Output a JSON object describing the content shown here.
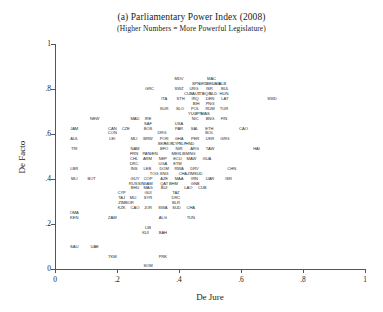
{
  "figure": {
    "title": "(a) Parliamentary Power Index (2008)",
    "subtitle": "(Higher Numbers = More Powerful Legislature)"
  },
  "chart_data": {
    "type": "scatter",
    "title": "(a) Parliamentary Power Index (2008)",
    "subtitle": "(Higher Numbers = More Powerful Legislature)",
    "xlabel": "De Jure",
    "ylabel": "De Facto",
    "xlim": [
      0,
      1
    ],
    "ylim": [
      0,
      1
    ],
    "xticks": [
      "0",
      ".2",
      ".4",
      ".6",
      ".8",
      "1"
    ],
    "xtickvalues": [
      0,
      0.2,
      0.4,
      0.6,
      0.8,
      1
    ],
    "yticks": [
      "0",
      ".2",
      ".4",
      ".6",
      ".8",
      "1"
    ],
    "ytickvalues": [
      0,
      0.2,
      0.4,
      0.6,
      0.8,
      1
    ],
    "grid": false,
    "legend": null,
    "marker_style": "text-label",
    "note": "Each observation is drawn as its three-letter country code instead of a marker.",
    "points": [
      {
        "label": "MDV",
        "x": 0.4,
        "y": 0.845
      },
      {
        "label": "MAC",
        "x": 0.505,
        "y": 0.845
      },
      {
        "label": "SPN",
        "x": 0.455,
        "y": 0.822
      },
      {
        "label": "GRD",
        "x": 0.478,
        "y": 0.822
      },
      {
        "label": "BEL",
        "x": 0.5,
        "y": 0.822
      },
      {
        "label": "VAN",
        "x": 0.52,
        "y": 0.822
      },
      {
        "label": "ALB",
        "x": 0.54,
        "y": 0.822
      },
      {
        "label": "GRC",
        "x": 0.305,
        "y": 0.8
      },
      {
        "label": "SWZ",
        "x": 0.4,
        "y": 0.8
      },
      {
        "label": "URG",
        "x": 0.448,
        "y": 0.8
      },
      {
        "label": "ISR",
        "x": 0.498,
        "y": 0.8
      },
      {
        "label": "BUL",
        "x": 0.548,
        "y": 0.8
      },
      {
        "label": "CUB",
        "x": 0.43,
        "y": 0.778
      },
      {
        "label": "AUT",
        "x": 0.455,
        "y": 0.778
      },
      {
        "label": "ITL",
        "x": 0.472,
        "y": 0.778
      },
      {
        "label": "EQG",
        "x": 0.49,
        "y": 0.778
      },
      {
        "label": "NLD",
        "x": 0.51,
        "y": 0.778
      },
      {
        "label": "HUN",
        "x": 0.545,
        "y": 0.778
      },
      {
        "label": "ITA",
        "x": 0.352,
        "y": 0.756
      },
      {
        "label": "STH",
        "x": 0.405,
        "y": 0.756
      },
      {
        "label": "IRQ",
        "x": 0.452,
        "y": 0.756
      },
      {
        "label": "DEN",
        "x": 0.5,
        "y": 0.756
      },
      {
        "label": "LAT",
        "x": 0.548,
        "y": 0.756
      },
      {
        "label": "SWD",
        "x": 0.7,
        "y": 0.756
      },
      {
        "label": "BIH",
        "x": 0.455,
        "y": 0.734
      },
      {
        "label": "PNG",
        "x": 0.5,
        "y": 0.734
      },
      {
        "label": "SUR",
        "x": 0.352,
        "y": 0.712
      },
      {
        "label": "SLO",
        "x": 0.403,
        "y": 0.712
      },
      {
        "label": "POL",
        "x": 0.452,
        "y": 0.712
      },
      {
        "label": "RUM",
        "x": 0.5,
        "y": 0.712
      },
      {
        "label": "TUR",
        "x": 0.545,
        "y": 0.712
      },
      {
        "label": "YUG",
        "x": 0.443,
        "y": 0.69
      },
      {
        "label": "JPN",
        "x": 0.463,
        "y": 0.69
      },
      {
        "label": "MAS",
        "x": 0.485,
        "y": 0.69
      },
      {
        "label": "NEW",
        "x": 0.128,
        "y": 0.668
      },
      {
        "label": "MAD",
        "x": 0.258,
        "y": 0.668
      },
      {
        "label": "IRE",
        "x": 0.3,
        "y": 0.668
      },
      {
        "label": "NIC",
        "x": 0.452,
        "y": 0.668
      },
      {
        "label": "BNG",
        "x": 0.5,
        "y": 0.668
      },
      {
        "label": "FIN",
        "x": 0.545,
        "y": 0.668
      },
      {
        "label": "SAF",
        "x": 0.3,
        "y": 0.646
      },
      {
        "label": "USA",
        "x": 0.4,
        "y": 0.646
      },
      {
        "label": "JAM",
        "x": 0.062,
        "y": 0.623
      },
      {
        "label": "CAN",
        "x": 0.185,
        "y": 0.623
      },
      {
        "label": "CZE",
        "x": 0.228,
        "y": 0.623
      },
      {
        "label": "BOS",
        "x": 0.3,
        "y": 0.623
      },
      {
        "label": "PAR",
        "x": 0.4,
        "y": 0.623
      },
      {
        "label": "SAL",
        "x": 0.45,
        "y": 0.623
      },
      {
        "label": "ETH",
        "x": 0.498,
        "y": 0.623
      },
      {
        "label": "CAO",
        "x": 0.608,
        "y": 0.623
      },
      {
        "label": "CON",
        "x": 0.185,
        "y": 0.604
      },
      {
        "label": "DRG",
        "x": 0.345,
        "y": 0.604
      },
      {
        "label": "BOL",
        "x": 0.498,
        "y": 0.604
      },
      {
        "label": "AUL",
        "x": 0.062,
        "y": 0.578
      },
      {
        "label": "LEI",
        "x": 0.185,
        "y": 0.578
      },
      {
        "label": "MLI",
        "x": 0.255,
        "y": 0.578
      },
      {
        "label": "BRW",
        "x": 0.3,
        "y": 0.578
      },
      {
        "label": "POR",
        "x": 0.352,
        "y": 0.578
      },
      {
        "label": "GHA",
        "x": 0.4,
        "y": 0.578
      },
      {
        "label": "PER",
        "x": 0.452,
        "y": 0.578
      },
      {
        "label": "UKR",
        "x": 0.5,
        "y": 0.578
      },
      {
        "label": "GRG",
        "x": 0.548,
        "y": 0.578
      },
      {
        "label": "BKF",
        "x": 0.345,
        "y": 0.556
      },
      {
        "label": "MOR",
        "x": 0.368,
        "y": 0.556
      },
      {
        "label": "CYP",
        "x": 0.39,
        "y": 0.556
      },
      {
        "label": "SLP",
        "x": 0.412,
        "y": 0.556
      },
      {
        "label": "HND",
        "x": 0.435,
        "y": 0.556
      },
      {
        "label": "TRI",
        "x": 0.062,
        "y": 0.534
      },
      {
        "label": "NAM",
        "x": 0.258,
        "y": 0.534
      },
      {
        "label": "BFO",
        "x": 0.352,
        "y": 0.534
      },
      {
        "label": "NIR",
        "x": 0.4,
        "y": 0.534
      },
      {
        "label": "ARG",
        "x": 0.45,
        "y": 0.534
      },
      {
        "label": "TAW",
        "x": 0.5,
        "y": 0.534
      },
      {
        "label": "HAI",
        "x": 0.65,
        "y": 0.534
      },
      {
        "label": "FRN",
        "x": 0.255,
        "y": 0.512
      },
      {
        "label": "PAN",
        "x": 0.295,
        "y": 0.512
      },
      {
        "label": "VEN",
        "x": 0.318,
        "y": 0.512
      },
      {
        "label": "MEX",
        "x": 0.39,
        "y": 0.512
      },
      {
        "label": "LIB",
        "x": 0.412,
        "y": 0.512
      },
      {
        "label": "MNG",
        "x": 0.438,
        "y": 0.512
      },
      {
        "label": "CHL",
        "x": 0.255,
        "y": 0.49
      },
      {
        "label": "ARM",
        "x": 0.298,
        "y": 0.49
      },
      {
        "label": "NEP",
        "x": 0.348,
        "y": 0.49
      },
      {
        "label": "ECU",
        "x": 0.395,
        "y": 0.49
      },
      {
        "label": "MAW",
        "x": 0.44,
        "y": 0.49
      },
      {
        "label": "GUA",
        "x": 0.49,
        "y": 0.49
      },
      {
        "label": "DRC",
        "x": 0.255,
        "y": 0.468
      },
      {
        "label": "UGA",
        "x": 0.348,
        "y": 0.468
      },
      {
        "label": "ETM",
        "x": 0.395,
        "y": 0.468
      },
      {
        "label": "LBR",
        "x": 0.062,
        "y": 0.446
      },
      {
        "label": "INS",
        "x": 0.255,
        "y": 0.446
      },
      {
        "label": "LEB",
        "x": 0.298,
        "y": 0.446
      },
      {
        "label": "DOM",
        "x": 0.352,
        "y": 0.446
      },
      {
        "label": "RWA",
        "x": 0.4,
        "y": 0.446
      },
      {
        "label": "DRV",
        "x": 0.45,
        "y": 0.446
      },
      {
        "label": "CHN",
        "x": 0.57,
        "y": 0.446
      },
      {
        "label": "TOG",
        "x": 0.32,
        "y": 0.424
      },
      {
        "label": "SNG",
        "x": 0.352,
        "y": 0.424
      },
      {
        "label": "CHA",
        "x": 0.412,
        "y": 0.424
      },
      {
        "label": "ZIM",
        "x": 0.438,
        "y": 0.424
      },
      {
        "label": "SUD",
        "x": 0.462,
        "y": 0.424
      },
      {
        "label": "MLI",
        "x": 0.062,
        "y": 0.402
      },
      {
        "label": "BOT",
        "x": 0.118,
        "y": 0.402
      },
      {
        "label": "GUY",
        "x": 0.258,
        "y": 0.402
      },
      {
        "label": "COP",
        "x": 0.3,
        "y": 0.402
      },
      {
        "label": "AZE",
        "x": 0.352,
        "y": 0.402
      },
      {
        "label": "MAA",
        "x": 0.4,
        "y": 0.402
      },
      {
        "label": "IRN",
        "x": 0.45,
        "y": 0.402
      },
      {
        "label": "UAR",
        "x": 0.5,
        "y": 0.402
      },
      {
        "label": "ISR",
        "x": 0.56,
        "y": 0.402
      },
      {
        "label": "RUS",
        "x": 0.252,
        "y": 0.38
      },
      {
        "label": "SIN",
        "x": 0.278,
        "y": 0.38
      },
      {
        "label": "GAM",
        "x": 0.3,
        "y": 0.38
      },
      {
        "label": "QAT",
        "x": 0.352,
        "y": 0.38
      },
      {
        "label": "BHM",
        "x": 0.382,
        "y": 0.38
      },
      {
        "label": "GNB",
        "x": 0.452,
        "y": 0.38
      },
      {
        "label": "BHU",
        "x": 0.258,
        "y": 0.358
      },
      {
        "label": "MAG",
        "x": 0.3,
        "y": 0.358
      },
      {
        "label": "BUI",
        "x": 0.352,
        "y": 0.358
      },
      {
        "label": "LAO",
        "x": 0.43,
        "y": 0.358
      },
      {
        "label": "CUB",
        "x": 0.475,
        "y": 0.358
      },
      {
        "label": "CYP",
        "x": 0.215,
        "y": 0.336
      },
      {
        "label": "GUI",
        "x": 0.3,
        "y": 0.336
      },
      {
        "label": "TAZ",
        "x": 0.39,
        "y": 0.336
      },
      {
        "label": "TAJ",
        "x": 0.215,
        "y": 0.314
      },
      {
        "label": "MLI",
        "x": 0.252,
        "y": 0.314
      },
      {
        "label": "SYR",
        "x": 0.3,
        "y": 0.314
      },
      {
        "label": "DRC",
        "x": 0.39,
        "y": 0.314
      },
      {
        "label": "ZIM",
        "x": 0.215,
        "y": 0.292
      },
      {
        "label": "BOR",
        "x": 0.24,
        "y": 0.292
      },
      {
        "label": "BLR",
        "x": 0.39,
        "y": 0.292
      },
      {
        "label": "KZK",
        "x": 0.215,
        "y": 0.27
      },
      {
        "label": "CAO",
        "x": 0.258,
        "y": 0.27
      },
      {
        "label": "JOR",
        "x": 0.3,
        "y": 0.27
      },
      {
        "label": "SWA",
        "x": 0.348,
        "y": 0.27
      },
      {
        "label": "SUD",
        "x": 0.392,
        "y": 0.27
      },
      {
        "label": "CHA",
        "x": 0.438,
        "y": 0.27
      },
      {
        "label": "OMA",
        "x": 0.062,
        "y": 0.248
      },
      {
        "label": "KEN",
        "x": 0.062,
        "y": 0.226
      },
      {
        "label": "ZAM",
        "x": 0.185,
        "y": 0.226
      },
      {
        "label": "ALG",
        "x": 0.348,
        "y": 0.226
      },
      {
        "label": "TUN",
        "x": 0.438,
        "y": 0.226
      },
      {
        "label": "LIB",
        "x": 0.3,
        "y": 0.182
      },
      {
        "label": "KUI",
        "x": 0.292,
        "y": 0.16
      },
      {
        "label": "BAH",
        "x": 0.348,
        "y": 0.16
      },
      {
        "label": "SAU",
        "x": 0.062,
        "y": 0.1
      },
      {
        "label": "UAE",
        "x": 0.128,
        "y": 0.1
      },
      {
        "label": "TKM",
        "x": 0.185,
        "y": 0.055
      },
      {
        "label": "PRK",
        "x": 0.348,
        "y": 0.055
      },
      {
        "label": "SOM",
        "x": 0.3,
        "y": 0.012
      }
    ]
  }
}
